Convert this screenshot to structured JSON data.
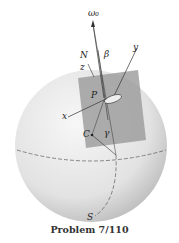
{
  "figure": {
    "caption": "Problem 7/110",
    "labels": {
      "omega0": "ω₀",
      "N": "N",
      "beta": "β",
      "z": "z",
      "y": "y",
      "P": "P",
      "x": "x",
      "C": "C",
      "gamma": "γ",
      "S": "S"
    },
    "colors": {
      "sphere_light": "#f4f4f4",
      "sphere_dark": "#bdbdbd",
      "plate": "#9a9a9a",
      "lines": "#333333"
    }
  }
}
